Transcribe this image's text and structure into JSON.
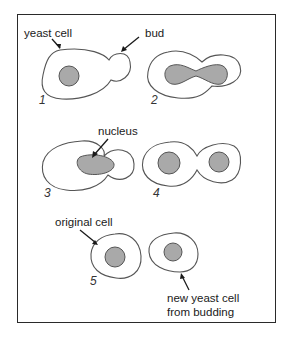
{
  "diagram": {
    "labels": {
      "yeast_cell": "yeast cell",
      "bud": "bud",
      "nucleus": "nucleus",
      "original_cell": "original cell",
      "new_cell_line1": "new yeast cell",
      "new_cell_line2": "from budding"
    },
    "stages": [
      {
        "number": "1",
        "description": "Yeast cell with a small bud forming"
      },
      {
        "number": "2",
        "description": "Nucleus elongates into the bud"
      },
      {
        "number": "3",
        "description": "Nucleus migrates toward the bud"
      },
      {
        "number": "4",
        "description": "Nucleus divides; each cell has a nucleus"
      },
      {
        "number": "5",
        "description": "Bud separates into a new yeast cell"
      }
    ],
    "colors": {
      "nucleus_fill": "#a9a9a9",
      "outline": "#555555",
      "frame": "#2a2a2a"
    }
  }
}
